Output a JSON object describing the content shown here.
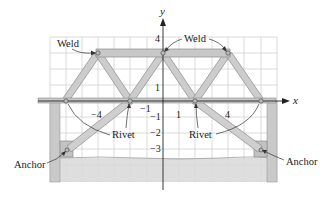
{
  "diagram": {
    "axes": {
      "x_label": "x",
      "y_label": "y",
      "x_ticks": [
        {
          "label": "−4",
          "x": 98,
          "y": 118
        },
        {
          "label": "−1",
          "x": 148,
          "y": 112
        },
        {
          "label": "1",
          "x": 179,
          "y": 118
        },
        {
          "label": "4",
          "x": 228,
          "y": 118
        }
      ],
      "y_ticks": [
        {
          "label": "4",
          "x": 157,
          "y": 41
        },
        {
          "label": "1",
          "x": 157,
          "y": 89
        },
        {
          "label": "−1",
          "x": 157,
          "y": 119
        },
        {
          "label": "−2",
          "x": 157,
          "y": 135
        },
        {
          "label": "−3",
          "x": 157,
          "y": 151
        }
      ]
    },
    "labels": {
      "weld_left": "Weld",
      "weld_right": "Weld",
      "rivet_left": "Rivet",
      "rivet_right": "Rivet",
      "anchor_left": "Anchor",
      "anchor_right": "Anchor"
    },
    "colors": {
      "beam_fill": "#c8c8c8",
      "beam_stroke": "#8a8a8a",
      "grid": "#cfcfcf",
      "ground": "#d6d6d6",
      "axis": "#222222"
    }
  }
}
